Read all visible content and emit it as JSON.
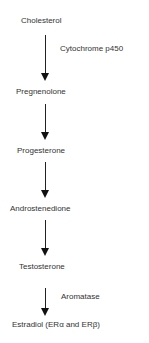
{
  "diagram": {
    "nodes": [
      {
        "label": "Cholesterol"
      },
      {
        "label": "Pregnenolone"
      },
      {
        "label": "Progesterone"
      },
      {
        "label": "Androstenedione"
      },
      {
        "label": "Testosterone"
      },
      {
        "label": "Estradiol (ERα and ERβ)"
      }
    ],
    "edges": [
      {
        "from": "Cholesterol",
        "to": "Pregnenolone",
        "label": "Cytochrome  p450"
      },
      {
        "from": "Pregnenolone",
        "to": "Progesterone",
        "label": ""
      },
      {
        "from": "Progesterone",
        "to": "Androstenedione",
        "label": ""
      },
      {
        "from": "Androstenedione",
        "to": "Testosterone",
        "label": ""
      },
      {
        "from": "Testosterone",
        "to": "Estradiol (ERα and ERβ)",
        "label": "Aromatase"
      }
    ]
  }
}
